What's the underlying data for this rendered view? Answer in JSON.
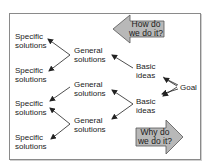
{
  "diagram": {
    "goal": {
      "label": "Goal"
    },
    "basic_ideas": [
      {
        "line1": "Basic",
        "line2": "ideas"
      },
      {
        "line1": "Basic",
        "line2": "ideas"
      }
    ],
    "general_solutions": [
      {
        "line1": "General",
        "line2": "solutions"
      },
      {
        "line1": "General",
        "line2": "solutions"
      },
      {
        "line1": "General",
        "line2": "solutions"
      }
    ],
    "specific_solutions": [
      {
        "line1": "Specific",
        "line2": "solutions"
      },
      {
        "line1": "Specific",
        "line2": "solutions"
      },
      {
        "line1": "Specific",
        "line2": "solutions"
      },
      {
        "line1": "Specific",
        "line2": "solutions"
      }
    ],
    "how_arrow": {
      "line1": "How do",
      "line2": "we do it?",
      "direction": "left"
    },
    "why_arrow": {
      "line1": "Why do",
      "line2": "we do it?",
      "direction": "right"
    },
    "colors": {
      "arrow_fill": "#b8b8b8",
      "arrow_stroke": "#555555",
      "line": "#222222",
      "frame": "#8a8a8a"
    }
  }
}
